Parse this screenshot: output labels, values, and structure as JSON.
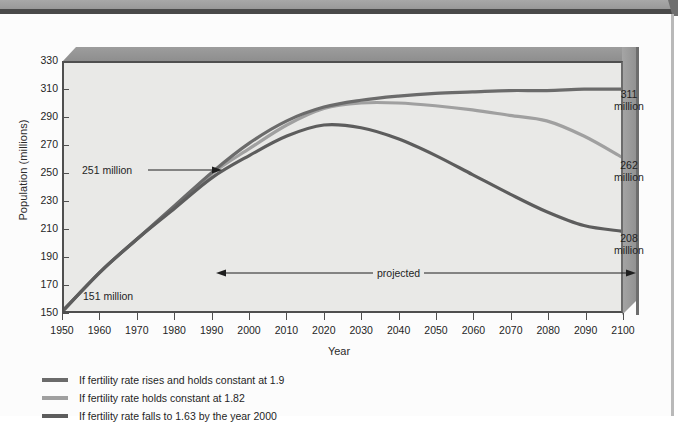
{
  "chart_data": {
    "type": "line",
    "title": "",
    "xlabel": "Year",
    "ylabel": "Population (millions)",
    "xlim": [
      1950,
      2100
    ],
    "ylim": [
      150,
      330
    ],
    "ytick_step": 20,
    "xtick_step": 10,
    "grid": false,
    "legend_position": "below-left",
    "x": [
      1950,
      1960,
      1970,
      1980,
      1990,
      2000,
      2010,
      2020,
      2030,
      2040,
      2050,
      2060,
      2070,
      2080,
      2090,
      2100
    ],
    "yticks": [
      150,
      170,
      190,
      210,
      230,
      250,
      270,
      290,
      310,
      330
    ],
    "xticks": [
      1950,
      1960,
      1970,
      1980,
      1990,
      2000,
      2010,
      2020,
      2030,
      2040,
      2050,
      2060,
      2070,
      2080,
      2090,
      2100
    ],
    "series": [
      {
        "name": "If fertility rate rises and holds constant at 1.9",
        "color": "#6b6b6b",
        "end_value": 311,
        "values": [
          151,
          179,
          203,
          227,
          251,
          272,
          288,
          298,
          303,
          306,
          308,
          309,
          310,
          310,
          311,
          311
        ]
      },
      {
        "name": "If fertility rate holds constant at 1.82",
        "color": "#a0a0a0",
        "end_value": 262,
        "values": [
          151,
          179,
          203,
          226,
          250,
          268,
          285,
          297,
          301,
          301,
          299,
          296,
          292,
          288,
          277,
          262
        ]
      },
      {
        "name": "If fertility rate falls to 1.63 by the year 2000",
        "color": "#5d5d5d",
        "end_value": 208,
        "values": [
          151,
          179,
          203,
          225,
          247,
          263,
          277,
          285,
          283,
          275,
          263,
          249,
          235,
          222,
          212,
          208
        ]
      }
    ],
    "annotations": [
      {
        "name": "start-label",
        "text": "151 million",
        "value": 151,
        "year": 1950
      },
      {
        "name": "divergence-label",
        "text": "251 million",
        "value": 251,
        "year": 1990
      },
      {
        "name": "end-label-high",
        "text": "311\nmillion",
        "value": 311,
        "year": 2100
      },
      {
        "name": "end-label-mid",
        "text": "262\nmillion",
        "value": 262,
        "year": 2100
      },
      {
        "name": "end-label-low",
        "text": "208\nmillion",
        "value": 208,
        "year": 2100
      },
      {
        "name": "projected-range",
        "text": "projected",
        "from_year": 1990,
        "to_year": 2100
      }
    ]
  },
  "axes": {
    "y_title": "Population (millions)",
    "x_title": "Year",
    "y_labels": [
      "330",
      "310",
      "290",
      "270",
      "250",
      "230",
      "210",
      "190",
      "170",
      "150"
    ],
    "x_labels": [
      "1950",
      "1960",
      "1970",
      "1980",
      "1990",
      "2000",
      "2010",
      "2020",
      "2030",
      "2040",
      "2050",
      "2060",
      "2070",
      "2080",
      "2090",
      "2100"
    ]
  },
  "annotations": {
    "divergence": "251 million",
    "start": "151 million",
    "end_high_value": "311",
    "end_high_unit": "million",
    "end_mid_value": "262",
    "end_mid_unit": "million",
    "end_low_value": "208",
    "end_low_unit": "million",
    "projected": "projected"
  },
  "legend": {
    "items": [
      {
        "label": "If fertility rate rises and holds constant at 1.9",
        "color": "#6b6b6b"
      },
      {
        "label": "If fertility rate holds constant at 1.82",
        "color": "#a0a0a0"
      },
      {
        "label": "If fertility rate falls to 1.63 by the year 2000",
        "color": "#5d5d5d"
      }
    ]
  },
  "colors": {
    "plot_background": "#e9e9e7",
    "axis": "#4f4f4f",
    "box_3d": "#9d9d9d",
    "page_background": "#fcfcfc",
    "top_band": "#9c9c9c"
  }
}
